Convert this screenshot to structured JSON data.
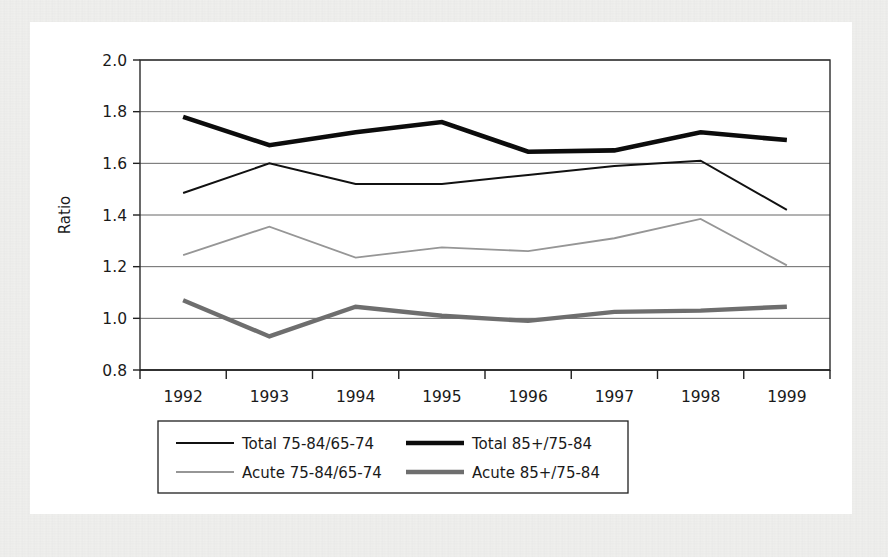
{
  "chart_data": {
    "type": "line",
    "title": "",
    "xlabel": "",
    "ylabel": "Ratio",
    "categories": [
      "1992",
      "1993",
      "1994",
      "1995",
      "1996",
      "1997",
      "1998",
      "1999"
    ],
    "ylim": [
      0.8,
      2.0
    ],
    "ytick_step": 0.2,
    "yticks": [
      "0.8",
      "1.0",
      "1.2",
      "1.4",
      "1.6",
      "1.8",
      "2.0"
    ],
    "grid": true,
    "legend_position": "bottom",
    "series": [
      {
        "name": "Total 75-84/65-74",
        "color": "#111111",
        "width": 2.0,
        "values": [
          1.485,
          1.6,
          1.52,
          1.52,
          1.555,
          1.59,
          1.61,
          1.42
        ]
      },
      {
        "name": "Total 85+/75-84",
        "color": "#0c0c0c",
        "width": 4.6,
        "values": [
          1.78,
          1.67,
          1.72,
          1.76,
          1.645,
          1.65,
          1.72,
          1.69
        ]
      },
      {
        "name": "Acute 75-84/65-74",
        "color": "#969696",
        "width": 1.8,
        "values": [
          1.245,
          1.355,
          1.235,
          1.275,
          1.26,
          1.31,
          1.385,
          1.205
        ]
      },
      {
        "name": "Acute 85+/75-84",
        "color": "#6e6e6e",
        "width": 4.4,
        "values": [
          1.07,
          0.93,
          1.045,
          1.01,
          0.99,
          1.025,
          1.03,
          1.045
        ]
      }
    ]
  },
  "legend": {
    "entries": [
      {
        "label": "Total 75-84/65-74",
        "series_index": 0
      },
      {
        "label": "Total 85+/75-84",
        "series_index": 1
      },
      {
        "label": "Acute 75-84/65-74",
        "series_index": 2
      },
      {
        "label": "Acute 85+/75-84",
        "series_index": 3
      }
    ]
  },
  "colors": {
    "page_background": "#f0f0ee",
    "figure_background": "#ffffff",
    "gridline": "#555555",
    "axis": "#1f1f1f",
    "text": "#1a1a1a"
  }
}
